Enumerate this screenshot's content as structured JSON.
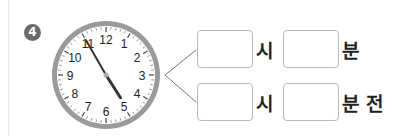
{
  "problem": {
    "number": "4",
    "clock": {
      "numbers": [
        "12",
        "1",
        "2",
        "3",
        "4",
        "5",
        "6",
        "7",
        "8",
        "9",
        "10",
        "11"
      ],
      "time_shown": {
        "hour": 4,
        "minute": 55
      }
    },
    "rows": [
      {
        "hour_unit": "시",
        "minute_unit": "분",
        "hour_value": "",
        "minute_value": ""
      },
      {
        "hour_unit": "시",
        "minute_unit": "분 전",
        "hour_value": "",
        "minute_value": ""
      }
    ]
  }
}
